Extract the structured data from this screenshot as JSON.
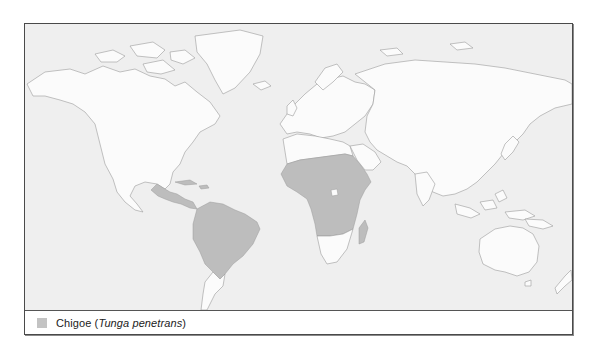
{
  "map": {
    "title": "Chigoe distribution",
    "background_color": "#efefef",
    "land_color": "#fbfbfb",
    "coast_color": "#9a9a9a",
    "endemic_color": "#bdbdbd",
    "endemic_regions": [
      "Mexico and Central America",
      "Caribbean",
      "South America (Brazil, northern & central)",
      "Sub-Saharan Africa",
      "Madagascar"
    ]
  },
  "legend": {
    "items": [
      {
        "swatch_color": "#c3c3c3",
        "common_name": "Chigoe",
        "scientific_name": "Tunga penetrans"
      }
    ]
  }
}
